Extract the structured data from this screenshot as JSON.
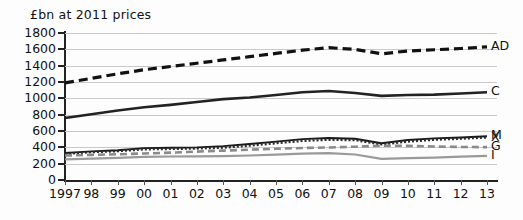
{
  "chart_data": {
    "type": "line",
    "title": "",
    "ylabel": "£bn at 2011 prices",
    "xlabel": "",
    "ylim": [
      0,
      1800
    ],
    "y_ticks": [
      0,
      200,
      400,
      600,
      800,
      1000,
      1200,
      1400,
      1600,
      1800
    ],
    "y_tick_labels": [
      "0",
      "200",
      "400",
      "600",
      "800",
      "1000",
      "1200",
      "1400",
      "1600",
      "1800"
    ],
    "grid": true,
    "legend_position": "right-inline",
    "x": [
      1997,
      1998,
      1999,
      2000,
      2001,
      2002,
      2003,
      2004,
      2005,
      2006,
      2007,
      2008,
      2009,
      2010,
      2011,
      2012,
      2013
    ],
    "categories": [
      "1997",
      "98",
      "99",
      "00",
      "01",
      "02",
      "03",
      "04",
      "05",
      "06",
      "07",
      "08",
      "09",
      "10",
      "11",
      "12",
      "13"
    ],
    "series": [
      {
        "name": "AD",
        "label": "AD",
        "style": "dashed",
        "color": "#111111",
        "width": 3.2,
        "values": [
          1190,
          1245,
          1300,
          1350,
          1390,
          1430,
          1470,
          1510,
          1550,
          1590,
          1620,
          1600,
          1545,
          1580,
          1595,
          1610,
          1630
        ]
      },
      {
        "name": "C",
        "label": "C",
        "style": "solid",
        "color": "#222222",
        "width": 2.6,
        "values": [
          760,
          805,
          850,
          890,
          920,
          955,
          990,
          1010,
          1040,
          1075,
          1090,
          1065,
          1030,
          1040,
          1045,
          1060,
          1075
        ]
      },
      {
        "name": "M",
        "label": "M",
        "style": "solid",
        "color": "#1a1a1a",
        "width": 1.9,
        "values": [
          330,
          350,
          365,
          390,
          395,
          400,
          415,
          440,
          470,
          500,
          515,
          505,
          450,
          490,
          510,
          520,
          535
        ]
      },
      {
        "name": "X",
        "label": "X",
        "style": "dotted",
        "color": "#2b2b2b",
        "width": 2.2,
        "values": [
          320,
          340,
          352,
          375,
          380,
          385,
          395,
          420,
          450,
          478,
          492,
          487,
          435,
          470,
          492,
          505,
          520
        ]
      },
      {
        "name": "G",
        "label": "G",
        "style": "dashed",
        "color": "#8a8a8a",
        "width": 2.6,
        "values": [
          300,
          308,
          315,
          325,
          335,
          348,
          360,
          372,
          382,
          392,
          398,
          408,
          420,
          418,
          410,
          405,
          402
        ]
      },
      {
        "name": "I",
        "label": "I",
        "style": "solid",
        "color": "#9a9a9a",
        "width": 2.2,
        "values": [
          252,
          262,
          272,
          282,
          288,
          290,
          292,
          300,
          310,
          322,
          330,
          312,
          258,
          268,
          275,
          285,
          295
        ]
      }
    ]
  },
  "axis": {
    "title": "£bn at 2011 prices"
  }
}
